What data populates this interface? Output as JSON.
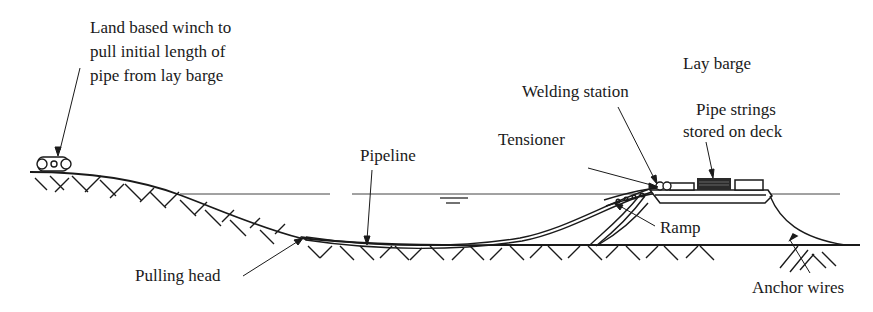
{
  "diagram": {
    "colors": {
      "ink": "#1a1a1a",
      "background": "#ffffff"
    },
    "labels": {
      "winch": {
        "line1": "Land based winch to",
        "line2": "pull initial length of",
        "line3": "pipe from lay barge"
      },
      "lay_barge": "Lay barge",
      "welding_station": "Welding station",
      "pipe_strings": {
        "line1": "Pipe strings",
        "line2": "stored on deck"
      },
      "tensioner": "Tensioner",
      "pipeline": "Pipeline",
      "ramp": "Ramp",
      "pulling_head": "Pulling head",
      "anchor_wires": "Anchor wires"
    },
    "components": [
      "land-based-winch",
      "shore-slope",
      "sea-surface",
      "seabed",
      "pipeline",
      "pulling-head",
      "lay-barge",
      "tensioner",
      "welding-station",
      "pipe-strings",
      "ramp",
      "anchor-wires"
    ]
  }
}
